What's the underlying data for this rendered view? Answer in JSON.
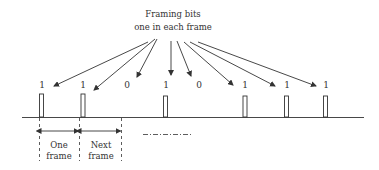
{
  "diagram": {
    "title_line1": "Framing bits",
    "title_line2": "one in each frame",
    "colors": {
      "stroke": "#333333",
      "background": "#ffffff"
    },
    "bits": [
      {
        "value": "1",
        "x": 42,
        "has_pulse": true
      },
      {
        "value": "1",
        "x": 83,
        "has_pulse": true
      },
      {
        "value": "0",
        "x": 127,
        "has_pulse": false
      },
      {
        "value": "1",
        "x": 166,
        "has_pulse": true
      },
      {
        "value": "0",
        "x": 199,
        "has_pulse": false
      },
      {
        "value": "1",
        "x": 245,
        "has_pulse": true
      },
      {
        "value": "1",
        "x": 287,
        "has_pulse": true
      },
      {
        "value": "1",
        "x": 326,
        "has_pulse": true
      }
    ],
    "frame_labels": {
      "one_frame_line1": "One",
      "one_frame_line2": "frame",
      "next_frame_line1": "Next",
      "next_frame_line2": "frame"
    },
    "continuation": "dash-dot"
  }
}
